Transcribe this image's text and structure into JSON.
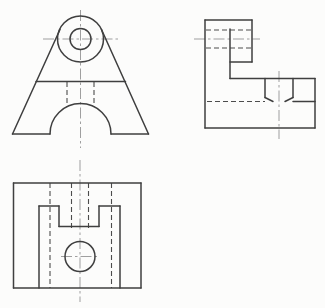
{
  "drawing": {
    "kind": "orthographic-projection-technical-drawing",
    "canvas": {
      "width": 325,
      "height": 308
    },
    "colors": {
      "background": "#fcfcfb",
      "visible_edge": "#3f3f3f",
      "hidden_edge": "#4c4c4c",
      "centerline": "#949494"
    },
    "views": [
      {
        "id": "front-view",
        "solid": [
          [
            12.5,
            134,
            60,
            29.5
          ],
          [
            148.5,
            134,
            101.5,
            29.5
          ],
          [
            12.5,
            134,
            50,
            134
          ],
          [
            111,
            134,
            148.5,
            134
          ],
          [
            36,
            81.5,
            125.5,
            81.5
          ]
        ],
        "arcs": [
          "M 50 134 A 30.5 30.5 0 0 1 111 134"
        ],
        "circles": [
          {
            "cx": 80.5,
            "cy": 39,
            "r": 23
          },
          {
            "cx": 80.5,
            "cy": 39,
            "r": 10.5
          }
        ],
        "dashed": [
          [
            67,
            82,
            67,
            107
          ],
          [
            94,
            82,
            94,
            107
          ]
        ],
        "center": [
          [
            80.5,
            10,
            80.5,
            148
          ],
          [
            43,
            39,
            118,
            39
          ]
        ]
      },
      {
        "id": "side-view",
        "solid": [
          [
            205,
            20,
            252,
            20
          ],
          [
            205,
            20,
            205,
            128
          ],
          [
            205,
            128,
            315,
            128
          ],
          [
            315,
            78.5,
            315,
            128
          ],
          [
            230,
            78.5,
            315,
            78.5
          ],
          [
            252,
            20,
            252,
            62
          ],
          [
            230,
            62,
            252,
            62
          ],
          [
            230,
            29,
            230,
            78.5
          ],
          [
            265,
            78.5,
            265,
            97.5
          ],
          [
            293,
            78.5,
            293,
            97.5
          ],
          [
            265,
            97.5,
            273,
            101.5
          ],
          [
            293,
            97.5,
            285,
            101.5
          ],
          [
            293,
            101.5,
            315,
            101.5
          ]
        ],
        "arcs": [],
        "circles": [],
        "dashed": [
          [
            206,
            30,
            251,
            30
          ],
          [
            206,
            48,
            251,
            48
          ],
          [
            207,
            101.5,
            265,
            101.5
          ]
        ],
        "center": [
          [
            194,
            39,
            260,
            39
          ],
          [
            279,
            71,
            279,
            139
          ]
        ]
      },
      {
        "id": "top-view",
        "solid": [
          [
            13.5,
            183,
            141,
            183
          ],
          [
            141,
            183,
            141,
            288
          ],
          [
            13.5,
            288,
            141,
            288
          ],
          [
            13.5,
            183,
            13.5,
            288
          ],
          [
            39,
            206,
            39,
            288
          ],
          [
            120,
            206,
            120,
            288
          ],
          [
            39,
            206,
            59,
            206
          ],
          [
            99,
            206,
            120,
            206
          ],
          [
            59,
            206,
            59,
            226.5
          ],
          [
            99,
            206,
            99,
            226.5
          ],
          [
            59,
            226.5,
            99,
            226.5
          ]
        ],
        "arcs": [],
        "circles": [
          {
            "cx": 80,
            "cy": 256.5,
            "r": 15
          }
        ],
        "dashed": [
          [
            50,
            183,
            50,
            288
          ],
          [
            111.5,
            183,
            111.5,
            288
          ],
          [
            71.5,
            183,
            71.5,
            228
          ],
          [
            88.5,
            183,
            88.5,
            228
          ]
        ],
        "center": [
          [
            80,
            160,
            80,
            302
          ],
          [
            61,
            256.5,
            99,
            256.5
          ]
        ]
      }
    ]
  }
}
